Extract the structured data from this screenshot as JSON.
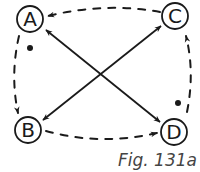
{
  "diagram": {
    "type": "directed-graph",
    "caption": "Fig. 131a",
    "colors": {
      "stroke": "#1a1a1a",
      "caption": "#444444",
      "background": "#ffffff"
    },
    "nodes": [
      {
        "id": "A",
        "label": "A",
        "x": 30,
        "y": 19,
        "r": 13,
        "dot": true
      },
      {
        "id": "B",
        "label": "B",
        "x": 28,
        "y": 130,
        "r": 13,
        "dot": false
      },
      {
        "id": "C",
        "label": "C",
        "x": 175,
        "y": 16,
        "r": 13,
        "dot": false
      },
      {
        "id": "D",
        "label": "D",
        "x": 174,
        "y": 132,
        "r": 13,
        "dot": true
      }
    ],
    "edges": [
      {
        "from": "A",
        "to": "B",
        "style": "dashed",
        "directed": true
      },
      {
        "from": "B",
        "to": "D",
        "style": "dashed",
        "directed": true
      },
      {
        "from": "D",
        "to": "C",
        "style": "dashed",
        "directed": true
      },
      {
        "from": "C",
        "to": "A",
        "style": "dashed",
        "directed": true
      },
      {
        "from": "A",
        "to": "D",
        "style": "solid",
        "directed": true,
        "bidirectional": true
      },
      {
        "from": "B",
        "to": "C",
        "style": "solid",
        "directed": true,
        "bidirectional": true
      }
    ]
  }
}
